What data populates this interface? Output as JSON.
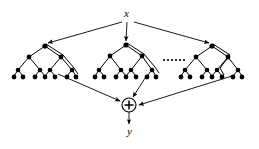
{
  "figure": {
    "name": "ensemble-of-decision-trees-diagram",
    "type": "diagram",
    "background_color": "#ffffff",
    "stroke_color": "#000000",
    "node_fill_color": "#000000"
  },
  "labels": {
    "input": "x",
    "output": "y",
    "sum_symbol": "+",
    "ellipsis": "······"
  },
  "nodes": {
    "input_node": {
      "id": "x",
      "cx": 128,
      "cy": 16
    },
    "sum_node": {
      "id": "plus",
      "cx": 129,
      "cy": 105,
      "r": 7
    },
    "output_node": {
      "id": "y",
      "cx": 129,
      "cy": 131
    }
  },
  "trees": [
    {
      "name": "tree-left",
      "root": {
        "x": 45,
        "y": 46
      },
      "internal": [
        {
          "x": 29,
          "y": 57
        },
        {
          "x": 61,
          "y": 57
        }
      ],
      "leaves": [
        {
          "x": 15,
          "y": 72
        },
        {
          "x": 29,
          "y": 72
        },
        {
          "x": 36,
          "y": 72
        },
        {
          "x": 50,
          "y": 72
        },
        {
          "x": 47,
          "y": 72
        },
        {
          "x": 61,
          "y": 72
        },
        {
          "x": 66,
          "y": 72
        },
        {
          "x": 74,
          "y": 72
        }
      ],
      "highlight_path": [
        {
          "x": 45,
          "y": 46
        },
        {
          "x": 61,
          "y": 57
        },
        {
          "x": 70,
          "y": 70
        }
      ]
    },
    {
      "name": "tree-middle",
      "root": {
        "x": 126,
        "y": 45
      },
      "internal": [
        {
          "x": 110,
          "y": 56
        },
        {
          "x": 142,
          "y": 56
        }
      ],
      "leaves": [
        {
          "x": 96,
          "y": 72
        },
        {
          "x": 110,
          "y": 72
        },
        {
          "x": 117,
          "y": 72
        },
        {
          "x": 131,
          "y": 72
        },
        {
          "x": 128,
          "y": 72
        },
        {
          "x": 142,
          "y": 72
        },
        {
          "x": 147,
          "y": 72
        },
        {
          "x": 155,
          "y": 72
        }
      ],
      "highlight_path": [
        {
          "x": 126,
          "y": 45
        },
        {
          "x": 142,
          "y": 56
        },
        {
          "x": 152,
          "y": 68
        }
      ]
    },
    {
      "name": "tree-right",
      "root": {
        "x": 212,
        "y": 46
      },
      "internal": [
        {
          "x": 196,
          "y": 57
        },
        {
          "x": 228,
          "y": 57
        }
      ],
      "leaves": [
        {
          "x": 182,
          "y": 72
        },
        {
          "x": 196,
          "y": 72
        },
        {
          "x": 203,
          "y": 72
        },
        {
          "x": 217,
          "y": 72
        },
        {
          "x": 214,
          "y": 72
        },
        {
          "x": 228,
          "y": 72
        },
        {
          "x": 233,
          "y": 72
        },
        {
          "x": 243,
          "y": 72
        }
      ],
      "highlight_path": [
        {
          "x": 212,
          "y": 46
        },
        {
          "x": 228,
          "y": 57
        },
        {
          "x": 236,
          "y": 70
        }
      ]
    }
  ],
  "edges_from_input": [
    {
      "name": "x-to-tree-left",
      "from": {
        "x": 122,
        "y": 22
      },
      "to": {
        "x": 47,
        "y": 43
      }
    },
    {
      "name": "x-to-tree-middle",
      "from": {
        "x": 127,
        "y": 22
      },
      "to": {
        "x": 126,
        "y": 42
      }
    },
    {
      "name": "x-to-tree-right",
      "from": {
        "x": 134,
        "y": 22
      },
      "to": {
        "x": 210,
        "y": 43
      }
    }
  ],
  "edges_to_sum": [
    {
      "name": "tree-left-to-sum",
      "from": {
        "x": 58,
        "y": 74
      },
      "to": {
        "x": 121,
        "y": 102
      }
    },
    {
      "name": "tree-middle-to-sum",
      "from": {
        "x": 145,
        "y": 74
      },
      "to": {
        "x": 132,
        "y": 97
      }
    },
    {
      "name": "tree-right-to-sum",
      "from": {
        "x": 231,
        "y": 75
      },
      "to": {
        "x": 138,
        "y": 105
      }
    }
  ],
  "edge_to_output": {
    "name": "sum-to-y",
    "from": {
      "x": 129,
      "y": 112
    },
    "to": {
      "x": 129,
      "y": 124
    }
  },
  "ellipsis_dots": [
    {
      "x": 163,
      "y": 60
    },
    {
      "x": 167,
      "y": 60
    },
    {
      "x": 171,
      "y": 60
    },
    {
      "x": 175,
      "y": 60
    },
    {
      "x": 179,
      "y": 60
    },
    {
      "x": 183,
      "y": 60
    }
  ]
}
